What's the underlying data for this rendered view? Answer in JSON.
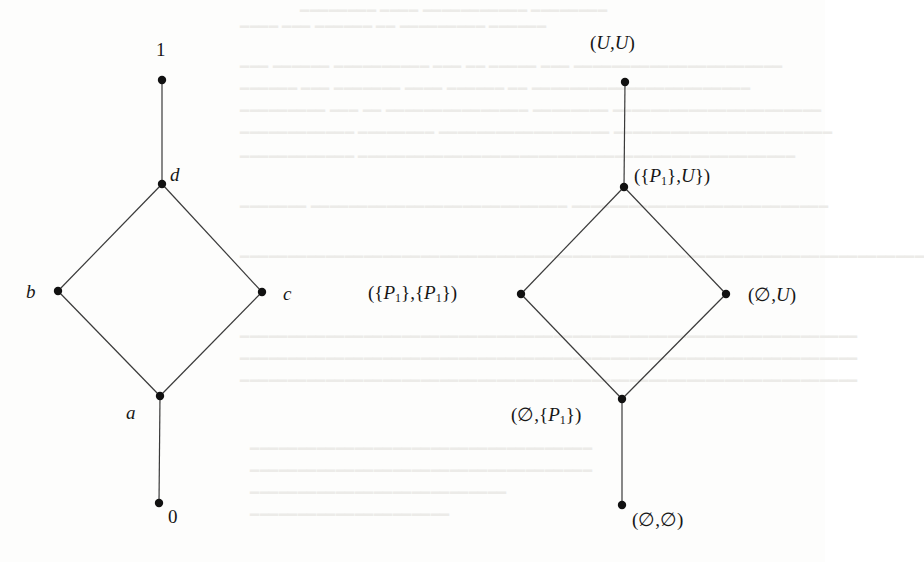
{
  "figure": {
    "colors": {
      "background": "#fdfdfc",
      "edge": "#3a3a3a",
      "node": "#111111",
      "label": "#161616",
      "bleed_through": "#ecebe8"
    }
  },
  "left_diagram": {
    "nodes": [
      {
        "id": "top",
        "label": "1",
        "x": 162,
        "y": 80
      },
      {
        "id": "d",
        "label": "d",
        "x": 162,
        "y": 184
      },
      {
        "id": "b",
        "label": "b",
        "x": 58,
        "y": 291
      },
      {
        "id": "c",
        "label": "c",
        "x": 262,
        "y": 292
      },
      {
        "id": "a",
        "label": "a",
        "x": 160,
        "y": 396
      },
      {
        "id": "bottom",
        "label": "0",
        "x": 159,
        "y": 503
      }
    ],
    "edges": [
      [
        "top",
        "d"
      ],
      [
        "d",
        "b"
      ],
      [
        "d",
        "c"
      ],
      [
        "b",
        "a"
      ],
      [
        "c",
        "a"
      ],
      [
        "a",
        "bottom"
      ]
    ],
    "labels": {
      "top": "1",
      "d": "d",
      "b": "b",
      "c": "c",
      "a": "a",
      "bottom": "0"
    }
  },
  "right_diagram": {
    "nodes": [
      {
        "id": "UU",
        "x": 625,
        "y": 82
      },
      {
        "id": "P1U",
        "x": 624,
        "y": 187
      },
      {
        "id": "P1P1",
        "x": 521,
        "y": 294
      },
      {
        "id": "emptyU",
        "x": 726,
        "y": 294
      },
      {
        "id": "emptyP1",
        "x": 622,
        "y": 399
      },
      {
        "id": "emptyEmpty",
        "x": 622,
        "y": 505
      }
    ],
    "edges": [
      [
        "UU",
        "P1U"
      ],
      [
        "P1U",
        "P1P1"
      ],
      [
        "P1U",
        "emptyU"
      ],
      [
        "P1P1",
        "emptyP1"
      ],
      [
        "emptyU",
        "emptyP1"
      ],
      [
        "emptyP1",
        "emptyEmpty"
      ]
    ],
    "labels": {
      "UU": {
        "pre": "(",
        "main": "U,U",
        "post": ")"
      },
      "P1U": {
        "a": "({",
        "b": "P",
        "sub": "1",
        "c": "},",
        "d": "U",
        "e": "})"
      },
      "P1P1": {
        "a": "({",
        "b": "P",
        "sub": "1",
        "c": "},{",
        "d": "P",
        "sub2": "1",
        "e": "})"
      },
      "emptyU": {
        "a": "(∅,",
        "b": "U",
        "c": ")"
      },
      "emptyP1": {
        "a": "(∅,{",
        "b": "P",
        "sub": "1",
        "c": "})"
      },
      "emptyEmpty": "(∅,∅)"
    }
  },
  "bleed_through_text": [
    " ",
    " "
  ]
}
